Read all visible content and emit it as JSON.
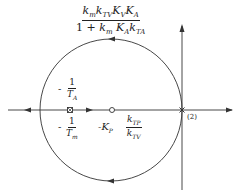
{
  "diagram": {
    "type": "root-locus",
    "gain_expression": {
      "numerator": "kₘkₜᵥKᵥKₐ",
      "numerator_display": "kmkTVKVKA",
      "denominator": "1 + kₘ Kₐkₜₐ",
      "denominator_display": "1 + km KA kTA"
    },
    "pole_labels": {
      "upper": {
        "sign": "-",
        "num": "1",
        "den": "T",
        "den_sub": "A"
      },
      "lower": {
        "sign": "-",
        "num": "1",
        "den": "T",
        "den_sub": "m"
      }
    },
    "zero_label": {
      "prefix": "-K",
      "prefix_sub": "P",
      "num": "k",
      "num_sub": "TP",
      "den": "k",
      "den_sub": "TV"
    },
    "origin_multiplicity": "(2)",
    "colors": {
      "line": "#333333",
      "background": "#ffffff"
    }
  }
}
